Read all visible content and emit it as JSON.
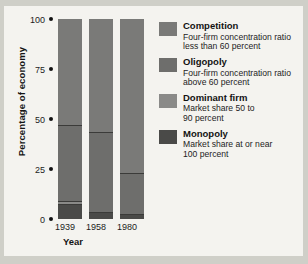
{
  "chart_data": {
    "type": "bar",
    "title": "",
    "subtitle": "",
    "xlabel": "Year",
    "ylabel": "Percentage of economy",
    "categories": [
      "1939",
      "1958",
      "1980"
    ],
    "ylim": [
      0,
      100
    ],
    "yticks": [
      "0",
      "25",
      "50",
      "75",
      "100"
    ],
    "grid": false,
    "stacked": true,
    "legend_position": "right",
    "series": [
      {
        "name": "Competition",
        "description_line1": "Four-firm concentration ratio",
        "description_line2": "less than 60 percent",
        "color": "#7a7a78",
        "values": [
          54,
          57,
          78
        ]
      },
      {
        "name": "Oligopoly",
        "description_line1": "Four-firm concentration ratio",
        "description_line2": "above 60 percent",
        "color": "#6e6e6c",
        "values": [
          38,
          40,
          20
        ]
      },
      {
        "name": "Dominant firm",
        "description_line1": "Market share 50 to",
        "description_line2": "90 percent",
        "color": "#8a8a88",
        "values": [
          1,
          0,
          0
        ]
      },
      {
        "name": "Monopoly",
        "description_line1": "Market share at or near",
        "description_line2": "100 percent",
        "color": "#4a4a48",
        "values": [
          7,
          3,
          2
        ]
      }
    ]
  },
  "axes": {
    "y_ticks": [
      {
        "label": "100",
        "value": 100
      },
      {
        "label": "75",
        "value": 75
      },
      {
        "label": "50",
        "value": 50
      },
      {
        "label": "25",
        "value": 25
      },
      {
        "label": "0",
        "value": 0
      }
    ],
    "y_title": "Percentage of economy",
    "x_title": "Year",
    "x_ticks": [
      "1939",
      "1958",
      "1980"
    ]
  },
  "legend": {
    "items": [
      {
        "label": "Competition",
        "line1": "Four-firm concentration ratio",
        "line2": "less than 60 percent",
        "color": "#7a7a78"
      },
      {
        "label": "Oligopoly",
        "line1": "Four-firm concentration ratio",
        "line2": "above 60 percent",
        "color": "#6e6e6c"
      },
      {
        "label": "Dominant firm",
        "line1": "Market share 50 to",
        "line2": "90 percent",
        "color": "#8a8a88"
      },
      {
        "label": "Monopoly",
        "line1": "Market share at or near",
        "line2": "100 percent",
        "color": "#4a4a48"
      }
    ]
  },
  "theme": {
    "page_background": "#cfcfc8",
    "paper_background": "#f4f3ef",
    "text_color": "#1a1a1a"
  }
}
